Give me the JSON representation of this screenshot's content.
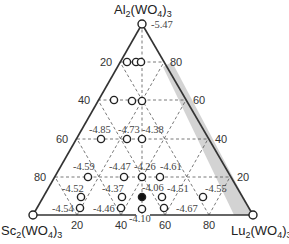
{
  "diagram": {
    "type": "ternary",
    "vertices": {
      "top": {
        "label": "Al2(WO4)3",
        "value": "-5.47"
      },
      "left": {
        "label": "Sc2(WO4)3"
      },
      "right": {
        "label": "Lu2(WO4)3"
      }
    },
    "ticks": {
      "left_side": [
        "20",
        "40",
        "60",
        "80"
      ],
      "right_side": [
        "80",
        "60",
        "40",
        "20"
      ],
      "bottom": [
        "20",
        "40",
        "60",
        "80"
      ]
    },
    "colors": {
      "shaded_region": "#d0d0d0",
      "edge": "#333333",
      "grid": "#555555"
    },
    "points": [
      {
        "x": 142,
        "y": 24,
        "filled": false,
        "label": "-5.47"
      },
      {
        "x": 127,
        "y": 62,
        "filled": false,
        "label": ""
      },
      {
        "x": 136,
        "y": 62,
        "filled": false,
        "label": ""
      },
      {
        "x": 141,
        "y": 62,
        "filled": false,
        "label": ""
      },
      {
        "x": 114,
        "y": 100,
        "filled": false,
        "label": ""
      },
      {
        "x": 132,
        "y": 101,
        "filled": false,
        "label": ""
      },
      {
        "x": 142,
        "y": 101,
        "filled": false,
        "label": ""
      },
      {
        "x": 101,
        "y": 139,
        "filled": false,
        "label": "-4.85"
      },
      {
        "x": 127,
        "y": 139,
        "filled": false,
        "label": "-4.73"
      },
      {
        "x": 142,
        "y": 139,
        "filled": false,
        "label": "-4.38"
      },
      {
        "x": 88,
        "y": 177,
        "filled": false,
        "label": "-4.59"
      },
      {
        "x": 124,
        "y": 177,
        "filled": false,
        "label": "-4.47"
      },
      {
        "x": 142,
        "y": 177,
        "filled": false,
        "label": "-4.26"
      },
      {
        "x": 160,
        "y": 177,
        "filled": false,
        "label": "-4.61"
      },
      {
        "x": 81,
        "y": 197,
        "filled": false,
        "label": "-4.52"
      },
      {
        "x": 122,
        "y": 197,
        "filled": false,
        "label": "-4.37"
      },
      {
        "x": 142,
        "y": 197,
        "filled": true,
        "label": "-4.06"
      },
      {
        "x": 162,
        "y": 197,
        "filled": false,
        "label": "-4.51"
      },
      {
        "x": 203,
        "y": 197,
        "filled": false,
        "label": "-4.55"
      },
      {
        "x": 80,
        "y": 208,
        "filled": false,
        "label": "-4.54"
      },
      {
        "x": 121,
        "y": 208,
        "filled": false,
        "label": "-4.46"
      },
      {
        "x": 142,
        "y": 209,
        "filled": false,
        "label": "-4.10"
      },
      {
        "x": 164,
        "y": 208,
        "filled": false,
        "label": "-4.67"
      }
    ],
    "value_labels": [
      {
        "x": 151,
        "y": 28,
        "text": "-5.47"
      },
      {
        "x": 89,
        "y": 133,
        "text": "-4.85"
      },
      {
        "x": 118,
        "y": 133,
        "text": "-4.73"
      },
      {
        "x": 142,
        "y": 133,
        "text": "-4.38"
      },
      {
        "x": 73,
        "y": 170,
        "text": "-4.59"
      },
      {
        "x": 109,
        "y": 170,
        "text": "-4.47"
      },
      {
        "x": 134,
        "y": 170,
        "text": "-4.26"
      },
      {
        "x": 160,
        "y": 170,
        "text": "-4.61"
      },
      {
        "x": 62,
        "y": 192,
        "text": "-4.52"
      },
      {
        "x": 102,
        "y": 192,
        "text": "-4.37"
      },
      {
        "x": 142,
        "y": 191,
        "text": "-4.06"
      },
      {
        "x": 167,
        "y": 192,
        "text": "-4.51"
      },
      {
        "x": 205,
        "y": 192,
        "text": "-4.55"
      },
      {
        "x": 52,
        "y": 212,
        "text": "-4.54"
      },
      {
        "x": 93,
        "y": 212,
        "text": "-4.46"
      },
      {
        "x": 129,
        "y": 222,
        "text": "-4.10"
      },
      {
        "x": 176,
        "y": 212,
        "text": "-4.67"
      }
    ]
  }
}
